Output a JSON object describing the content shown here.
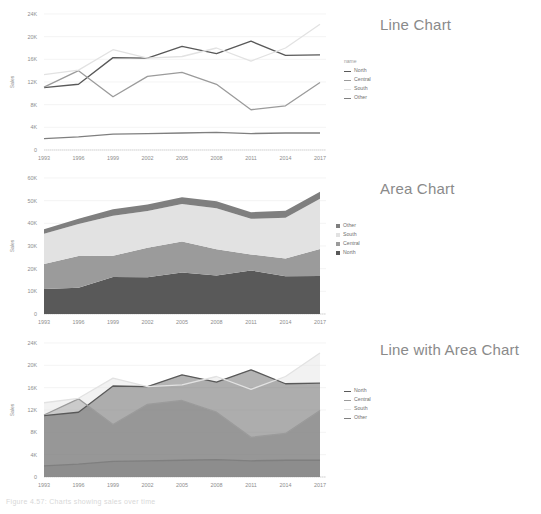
{
  "figure": {
    "caption": "Figure 4.57: Charts showing sales over time",
    "background": "#ffffff"
  },
  "palette": {
    "north": "#595959",
    "central": "#9b9b9b",
    "south": "#e2e2e2",
    "other": "#7f7f7f",
    "axis": "#d9d9d9",
    "grid": "#ececec",
    "text": "#8d8d8d",
    "title": "#8a8a8a"
  },
  "panels": [
    {
      "id": "line-chart",
      "title": "Line Chart",
      "legend": {
        "title": "name",
        "style": "line",
        "items": [
          {
            "label": "North",
            "color": "#595959"
          },
          {
            "label": "Central",
            "color": "#9b9b9b"
          },
          {
            "label": "South",
            "color": "#e2e2e2"
          },
          {
            "label": "Other",
            "color": "#7f7f7f"
          }
        ]
      }
    },
    {
      "id": "area-chart",
      "title": "Area Chart",
      "legend": {
        "title": "",
        "style": "swatch",
        "items": [
          {
            "label": "Other",
            "color": "#7f7f7f"
          },
          {
            "label": "South",
            "color": "#e2e2e2"
          },
          {
            "label": "Central",
            "color": "#9b9b9b"
          },
          {
            "label": "North",
            "color": "#595959"
          }
        ]
      }
    },
    {
      "id": "line-area-chart",
      "title": "Line with Area Chart",
      "legend": {
        "title": "",
        "style": "line",
        "items": [
          {
            "label": "North",
            "color": "#595959"
          },
          {
            "label": "Central",
            "color": "#9b9b9b"
          },
          {
            "label": "South",
            "color": "#e2e2e2"
          },
          {
            "label": "Other",
            "color": "#7f7f7f"
          }
        ]
      }
    }
  ],
  "chart_data": [
    {
      "type": "line",
      "title": "Line Chart",
      "xlabel": "",
      "ylabel": "Sales",
      "x": [
        1993,
        1996,
        1999,
        2002,
        2005,
        2008,
        2011,
        2014,
        2017
      ],
      "xticks": [
        "1993",
        "1996",
        "1999",
        "2002",
        "2005",
        "2008",
        "2011",
        "2014",
        "2017"
      ],
      "yticks": [
        "0",
        "4K",
        "8K",
        "12K",
        "16K",
        "20K",
        "24K"
      ],
      "ylim": [
        0,
        24000
      ],
      "grid": true,
      "legend_position": "right",
      "legend_title": "name",
      "series": [
        {
          "name": "North",
          "color": "#595959",
          "values": [
            11000,
            11600,
            16300,
            16200,
            18300,
            17000,
            19200,
            16700,
            16800
          ]
        },
        {
          "name": "Central",
          "color": "#9b9b9b",
          "values": [
            11100,
            14000,
            9400,
            13000,
            13700,
            11600,
            7100,
            7800,
            11900
          ]
        },
        {
          "name": "South",
          "color": "#e2e2e2",
          "values": [
            13300,
            14100,
            17700,
            16200,
            16500,
            18000,
            15700,
            18000,
            22200
          ]
        },
        {
          "name": "Other",
          "color": "#7f7f7f",
          "values": [
            2000,
            2300,
            2800,
            2900,
            3000,
            3100,
            2900,
            3000,
            3000
          ]
        }
      ]
    },
    {
      "type": "area",
      "stacked": true,
      "title": "Area Chart",
      "xlabel": "",
      "ylabel": "Sales",
      "x": [
        1993,
        1996,
        1999,
        2002,
        2005,
        2008,
        2011,
        2014,
        2017
      ],
      "xticks": [
        "1993",
        "1996",
        "1999",
        "2002",
        "2005",
        "2008",
        "2011",
        "2014",
        "2017"
      ],
      "yticks": [
        "0",
        "10K",
        "20K",
        "30K",
        "40K",
        "50K",
        "60K"
      ],
      "ylim": [
        0,
        60000
      ],
      "grid": true,
      "legend_position": "right",
      "series": [
        {
          "name": "North",
          "color": "#595959",
          "values": [
            11000,
            11600,
            16300,
            16200,
            18300,
            17000,
            19200,
            16700,
            16800
          ]
        },
        {
          "name": "Central",
          "color": "#9b9b9b",
          "values": [
            11100,
            14000,
            9400,
            13000,
            13700,
            11600,
            7100,
            7800,
            11900
          ]
        },
        {
          "name": "South",
          "color": "#e2e2e2",
          "values": [
            13300,
            14100,
            17700,
            16200,
            16500,
            18000,
            15700,
            18000,
            22200
          ]
        },
        {
          "name": "Other",
          "color": "#7f7f7f",
          "values": [
            2000,
            2300,
            2800,
            2900,
            3000,
            3100,
            2900,
            3000,
            3000
          ]
        }
      ]
    },
    {
      "type": "area",
      "stacked": false,
      "title": "Line with Area Chart",
      "xlabel": "",
      "ylabel": "Sales",
      "x": [
        1993,
        1996,
        1999,
        2002,
        2005,
        2008,
        2011,
        2014,
        2017
      ],
      "xticks": [
        "1993",
        "1996",
        "1999",
        "2002",
        "2005",
        "2008",
        "2011",
        "2014",
        "2017"
      ],
      "yticks": [
        "0",
        "4K",
        "8K",
        "12K",
        "16K",
        "20K",
        "24K"
      ],
      "ylim": [
        0,
        24000
      ],
      "grid": true,
      "legend_position": "right",
      "series": [
        {
          "name": "North",
          "color": "#595959",
          "values": [
            11000,
            11600,
            16300,
            16200,
            18300,
            17000,
            19200,
            16700,
            16800
          ]
        },
        {
          "name": "Central",
          "color": "#9b9b9b",
          "values": [
            11100,
            14000,
            9400,
            13000,
            13700,
            11600,
            7100,
            7800,
            11900
          ]
        },
        {
          "name": "South",
          "color": "#e2e2e2",
          "values": [
            13300,
            14100,
            17700,
            16200,
            16500,
            18000,
            15700,
            18000,
            22200
          ]
        },
        {
          "name": "Other",
          "color": "#7f7f7f",
          "values": [
            2000,
            2300,
            2800,
            2900,
            3000,
            3100,
            2900,
            3000,
            3000
          ]
        }
      ]
    }
  ]
}
